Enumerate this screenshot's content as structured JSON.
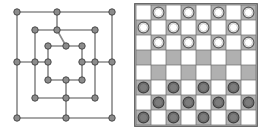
{
  "page": {
    "background_color": "#ffffff",
    "width": 264,
    "height": 132
  },
  "figures": [
    {
      "id": "graph-figure",
      "name": "nested-square-lattice-graph",
      "caption": "",
      "style": {
        "node_fill": "#8c8c8c",
        "node_stroke": "#4a4a4a",
        "node_radius": 3.2,
        "edge_color": "#8a8a8a",
        "edge_width": 1.6,
        "background": "#ffffff"
      },
      "nodes": [
        {
          "id": "n1",
          "x": 17,
          "y": 12,
          "label": ""
        },
        {
          "id": "n2",
          "x": 57,
          "y": 12,
          "label": ""
        },
        {
          "id": "n3",
          "x": 112,
          "y": 12,
          "label": ""
        },
        {
          "id": "n4",
          "x": 35,
          "y": 30,
          "label": ""
        },
        {
          "id": "n5",
          "x": 57,
          "y": 30,
          "label": ""
        },
        {
          "id": "n6",
          "x": 95,
          "y": 30,
          "label": ""
        },
        {
          "id": "n7",
          "x": 48,
          "y": 46,
          "label": ""
        },
        {
          "id": "n8",
          "x": 66,
          "y": 46,
          "label": ""
        },
        {
          "id": "n9",
          "x": 82,
          "y": 46,
          "label": ""
        },
        {
          "id": "n10",
          "x": 17,
          "y": 62,
          "label": ""
        },
        {
          "id": "n11",
          "x": 35,
          "y": 62,
          "label": ""
        },
        {
          "id": "n12",
          "x": 48,
          "y": 62,
          "label": ""
        },
        {
          "id": "n13",
          "x": 82,
          "y": 62,
          "label": ""
        },
        {
          "id": "n14",
          "x": 95,
          "y": 62,
          "label": ""
        },
        {
          "id": "n15",
          "x": 112,
          "y": 62,
          "label": ""
        },
        {
          "id": "n16",
          "x": 48,
          "y": 80,
          "label": ""
        },
        {
          "id": "n17",
          "x": 66,
          "y": 80,
          "label": ""
        },
        {
          "id": "n18",
          "x": 82,
          "y": 80,
          "label": ""
        },
        {
          "id": "n19",
          "x": 35,
          "y": 98,
          "label": ""
        },
        {
          "id": "n20",
          "x": 66,
          "y": 98,
          "label": ""
        },
        {
          "id": "n21",
          "x": 95,
          "y": 98,
          "label": ""
        },
        {
          "id": "n22",
          "x": 17,
          "y": 118,
          "label": ""
        },
        {
          "id": "n23",
          "x": 66,
          "y": 118,
          "label": ""
        },
        {
          "id": "n24",
          "x": 112,
          "y": 118,
          "label": ""
        }
      ],
      "edges": [
        {
          "from": "n1",
          "to": "n2"
        },
        {
          "from": "n2",
          "to": "n3"
        },
        {
          "from": "n1",
          "to": "n10"
        },
        {
          "from": "n10",
          "to": "n22"
        },
        {
          "from": "n3",
          "to": "n15"
        },
        {
          "from": "n15",
          "to": "n24"
        },
        {
          "from": "n22",
          "to": "n23"
        },
        {
          "from": "n23",
          "to": "n24"
        },
        {
          "from": "n2",
          "to": "n5"
        },
        {
          "from": "n4",
          "to": "n5"
        },
        {
          "from": "n5",
          "to": "n6"
        },
        {
          "from": "n4",
          "to": "n11"
        },
        {
          "from": "n11",
          "to": "n19"
        },
        {
          "from": "n6",
          "to": "n14"
        },
        {
          "from": "n14",
          "to": "n21"
        },
        {
          "from": "n19",
          "to": "n20"
        },
        {
          "from": "n20",
          "to": "n21"
        },
        {
          "from": "n20",
          "to": "n23"
        },
        {
          "from": "n10",
          "to": "n11"
        },
        {
          "from": "n11",
          "to": "n12"
        },
        {
          "from": "n13",
          "to": "n14"
        },
        {
          "from": "n14",
          "to": "n15"
        },
        {
          "from": "n7",
          "to": "n8"
        },
        {
          "from": "n8",
          "to": "n9"
        },
        {
          "from": "n8",
          "to": "n5"
        },
        {
          "from": "n7",
          "to": "n12"
        },
        {
          "from": "n12",
          "to": "n16"
        },
        {
          "from": "n9",
          "to": "n13"
        },
        {
          "from": "n13",
          "to": "n18"
        },
        {
          "from": "n16",
          "to": "n17"
        },
        {
          "from": "n17",
          "to": "n18"
        },
        {
          "from": "n17",
          "to": "n20"
        }
      ]
    },
    {
      "id": "board-figure",
      "name": "checkers-board",
      "caption": "",
      "board": {
        "rows": 8,
        "cols": 8,
        "origin_x": 4,
        "origin_y": 5,
        "cell_size": 15,
        "light_square_color": "#ffffff",
        "dark_square_color": "#b0b0b0",
        "grid_line_color": "#6e6e6e",
        "border_color": "#5a5a5a",
        "white_piece_fill": "#ffffff",
        "white_piece_stroke": "#595959",
        "dark_piece_fill": "#7d7d7d",
        "dark_piece_stroke": "#3c3c3c",
        "piece_radius": 5.4,
        "piece_inner_radius": 4.0,
        "square_colors": [
          [
            "light",
            "dark",
            "light",
            "dark",
            "light",
            "dark",
            "light",
            "dark"
          ],
          [
            "dark",
            "light",
            "dark",
            "light",
            "dark",
            "light",
            "dark",
            "light"
          ],
          [
            "light",
            "dark",
            "light",
            "dark",
            "light",
            "dark",
            "light",
            "dark"
          ],
          [
            "dark",
            "light",
            "dark",
            "light",
            "dark",
            "light",
            "dark",
            "light"
          ],
          [
            "light",
            "dark",
            "light",
            "dark",
            "light",
            "dark",
            "light",
            "dark"
          ],
          [
            "dark",
            "light",
            "dark",
            "light",
            "dark",
            "light",
            "dark",
            "light"
          ],
          [
            "light",
            "dark",
            "light",
            "dark",
            "light",
            "dark",
            "light",
            "dark"
          ],
          [
            "dark",
            "light",
            "dark",
            "light",
            "dark",
            "light",
            "dark",
            "light"
          ]
        ],
        "pieces": [
          [
            "",
            "white",
            "",
            "white",
            "",
            "white",
            "",
            "white"
          ],
          [
            "white",
            "",
            "white",
            "",
            "white",
            "",
            "white",
            ""
          ],
          [
            "",
            "white",
            "",
            "white",
            "",
            "white",
            "",
            "white"
          ],
          [
            "",
            "",
            "",
            "",
            "",
            "",
            "",
            ""
          ],
          [
            "",
            "",
            "",
            "",
            "",
            "",
            "",
            ""
          ],
          [
            "dark",
            "",
            "dark",
            "",
            "dark",
            "",
            "dark",
            ""
          ],
          [
            "",
            "dark",
            "",
            "dark",
            "",
            "dark",
            "",
            "dark"
          ],
          [
            "dark",
            "",
            "dark",
            "",
            "dark",
            "",
            "dark",
            ""
          ]
        ],
        "piece_counts": {
          "white": 12,
          "dark": 12
        }
      }
    }
  ]
}
